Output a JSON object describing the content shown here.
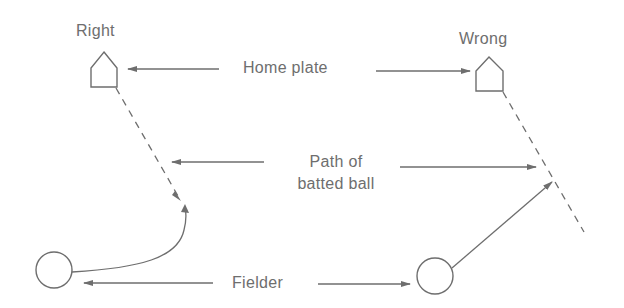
{
  "diagram": {
    "left_title": "Right",
    "right_title": "Wrong",
    "labels": {
      "home_plate": "Home plate",
      "path_line1": "Path of",
      "path_line2": "batted ball",
      "fielder": "Fielder"
    },
    "colors": {
      "stroke": "#6e6e6e",
      "text": "#6e6e6e",
      "background": "#ffffff"
    }
  }
}
